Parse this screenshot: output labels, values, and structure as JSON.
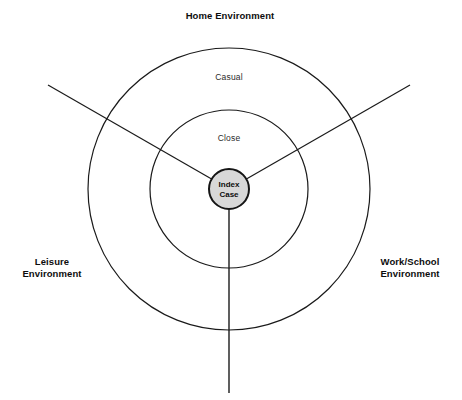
{
  "diagram": {
    "title": "Home Environment",
    "center_node": {
      "line1": "Index",
      "line2": "Case"
    },
    "rings": [
      {
        "label": "Close",
        "radius": 79
      },
      {
        "label": "Casual",
        "radius": 141
      }
    ],
    "ring_labels": {
      "inner": "Close",
      "outer": "Casual"
    },
    "environments": {
      "top": "Home Environment",
      "left_line1": "Leisure",
      "left_line2": "Environment",
      "right_line1": "Work/School",
      "right_line2": "Environment"
    },
    "colors": {
      "stroke": "#1a1a1a",
      "center_fill": "#d8d8d8",
      "background": "#ffffff",
      "text": "#0d0d0d"
    },
    "geometry": {
      "center_x": 229,
      "center_y": 189,
      "inner_radius": 20,
      "middle_radius": 79,
      "outer_radius": 141,
      "divider_up_left": "48,85",
      "divider_up_right": "410,85",
      "divider_down": "229,393"
    }
  }
}
